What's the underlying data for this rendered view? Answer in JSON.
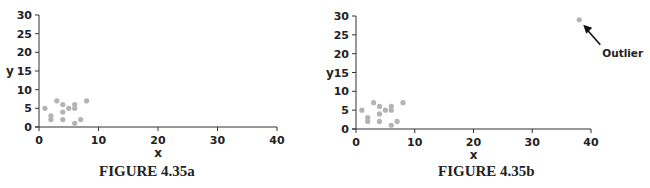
{
  "chart_data": [
    {
      "id": "a",
      "type": "scatter",
      "title": "",
      "caption": "FIGURE 4.35a",
      "xlabel": "x",
      "ylabel": "y",
      "xlim": [
        0,
        40
      ],
      "ylim": [
        0,
        30
      ],
      "xticks": [
        0,
        10,
        20,
        30,
        40
      ],
      "yticks": [
        0,
        5,
        10,
        15,
        20,
        25,
        30
      ],
      "grid": false,
      "legend": null,
      "point_color": "#b3b3b3",
      "series": [
        {
          "name": "data",
          "x": [
            1,
            2,
            2,
            3,
            4,
            4,
            4,
            5,
            6,
            6,
            6,
            7,
            8
          ],
          "y": [
            5,
            3,
            2,
            7,
            6,
            4,
            2,
            5,
            6,
            5,
            1,
            2,
            7
          ]
        }
      ]
    },
    {
      "id": "b",
      "type": "scatter",
      "title": "",
      "caption": "FIGURE 4.35b",
      "xlabel": "x",
      "ylabel": "y",
      "xlim": [
        0,
        40
      ],
      "ylim": [
        0,
        30
      ],
      "xticks": [
        0,
        10,
        20,
        30,
        40
      ],
      "yticks": [
        0,
        5,
        10,
        15,
        20,
        25,
        30
      ],
      "grid": false,
      "legend": null,
      "point_color": "#b3b3b3",
      "series": [
        {
          "name": "data",
          "x": [
            1,
            2,
            2,
            3,
            4,
            4,
            4,
            5,
            6,
            6,
            6,
            7,
            8,
            38
          ],
          "y": [
            5,
            3,
            2,
            7,
            6,
            4,
            2,
            5,
            6,
            5,
            1,
            2,
            7,
            29
          ]
        }
      ],
      "annotations": [
        {
          "text": "Outlier",
          "target": [
            38,
            29
          ],
          "arrow": true
        }
      ]
    }
  ],
  "figures": {
    "a": {
      "caption": "FIGURE 4.35a",
      "xlabel": "x",
      "ylabel": "y"
    },
    "b": {
      "caption": "FIGURE 4.35b",
      "xlabel": "x",
      "ylabel": "y",
      "annotation": "Outlier"
    }
  }
}
